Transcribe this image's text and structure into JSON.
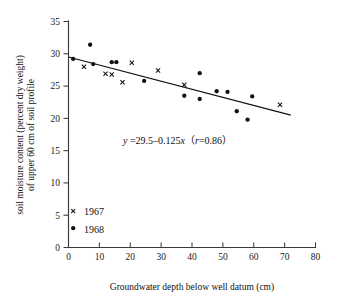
{
  "chart_data": {
    "type": "scatter",
    "title": "",
    "xlabel": "Groundwater depth below well datum (cm)",
    "ylabel": "soil moisture content (percent dry weight) of upper 60 cm of soil profile",
    "ylabel_line1": "soil moisture content (percent dry weight)",
    "ylabel_line2": "of upper 60 cm of soil profile",
    "xlim": [
      0,
      80
    ],
    "ylim": [
      0,
      35
    ],
    "xticks": [
      0,
      10,
      20,
      30,
      40,
      50,
      60,
      70,
      80
    ],
    "yticks": [
      0,
      5,
      10,
      15,
      20,
      25,
      30,
      35
    ],
    "xtick_labels": [
      "0",
      "10",
      "20",
      "30",
      "40",
      "50",
      "60",
      "70",
      "80"
    ],
    "ytick_labels": [
      "0",
      "5",
      "10",
      "15",
      "20",
      "25",
      "30",
      "35"
    ],
    "grid": false,
    "legend_position": "lower-left-inside",
    "series": [
      {
        "name": "1967",
        "marker": "cross",
        "color": "#111111",
        "points": [
          {
            "x": 5.0,
            "y": 28.0
          },
          {
            "x": 12.0,
            "y": 26.9
          },
          {
            "x": 14.0,
            "y": 26.8
          },
          {
            "x": 17.5,
            "y": 25.6
          },
          {
            "x": 20.5,
            "y": 28.6
          },
          {
            "x": 29.0,
            "y": 27.4
          },
          {
            "x": 37.5,
            "y": 25.2
          },
          {
            "x": 68.5,
            "y": 22.1
          }
        ]
      },
      {
        "name": "1968",
        "marker": "dot",
        "color": "#111111",
        "points": [
          {
            "x": 1.5,
            "y": 29.2
          },
          {
            "x": 7.0,
            "y": 31.4
          },
          {
            "x": 8.0,
            "y": 28.4
          },
          {
            "x": 14.0,
            "y": 28.7
          },
          {
            "x": 15.5,
            "y": 28.7
          },
          {
            "x": 24.5,
            "y": 25.8
          },
          {
            "x": 37.5,
            "y": 23.5
          },
          {
            "x": 42.5,
            "y": 27.0
          },
          {
            "x": 42.5,
            "y": 23.0
          },
          {
            "x": 48.0,
            "y": 24.2
          },
          {
            "x": 51.5,
            "y": 24.1
          },
          {
            "x": 54.5,
            "y": 21.1
          },
          {
            "x": 58.0,
            "y": 19.8
          },
          {
            "x": 59.5,
            "y": 23.4
          }
        ]
      }
    ],
    "fit_line": {
      "intercept": 29.5,
      "slope": -0.125,
      "r": 0.86,
      "x_start": 0,
      "x_end": 72,
      "equation_text": "y =29.5–0.125x（r=0.86）",
      "equation_parts": {
        "y_sym": "y",
        "rhs": " =29.5–0.125",
        "x_sym": "x",
        "paren_open": "（",
        "r_sym": "r",
        "r_value": "=0.86",
        "paren_close": "）"
      }
    },
    "legend": [
      {
        "label": "1967",
        "marker": "cross"
      },
      {
        "label": "1968",
        "marker": "dot"
      }
    ]
  },
  "colors": {
    "axis": "#3a3a3a",
    "text": "#111111",
    "marker": "#111111",
    "background": "#ffffff"
  }
}
